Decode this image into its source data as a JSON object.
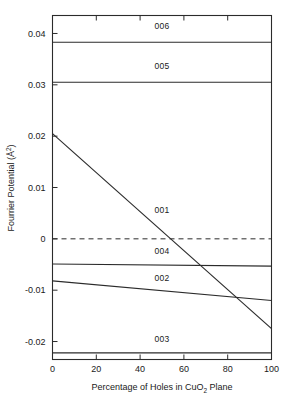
{
  "chart_data": {
    "type": "line",
    "title": "",
    "xlabel": "Percentage of Holes in CuO2  Plane",
    "xlabel_parts": {
      "before": "Percentage of Holes in CuO",
      "sub": "2",
      "after": " Plane"
    },
    "ylabel": "Fourrier Potential (Å²)",
    "ylabel_parts": {
      "before": "Fourrier Potential (Å",
      "sup": "2",
      "after": ")"
    },
    "xlim": [
      0,
      100
    ],
    "ylim": [
      -0.0235,
      0.0435
    ],
    "grid": false,
    "legend": "inline-labels",
    "x_ticks": [
      0,
      20,
      40,
      60,
      80,
      100
    ],
    "x_tick_labels": [
      "0",
      "20",
      "40",
      "60",
      "80",
      "100"
    ],
    "y_ticks": [
      0.04,
      0.03,
      0.02,
      0.01,
      0,
      -0.01,
      -0.02
    ],
    "y_tick_labels": [
      "0.04",
      "0.03",
      "0.02",
      "0.01",
      "0",
      "-0.01",
      "-0.02"
    ],
    "zero_reference_line": {
      "value": 0,
      "style": "dashed"
    },
    "x": [
      0,
      100
    ],
    "series": [
      {
        "name": "006",
        "label": "006",
        "values": [
          0.0383,
          0.0383
        ],
        "label_x": 50,
        "label_y": 0.0408
      },
      {
        "name": "005",
        "label": "005",
        "values": [
          0.0305,
          0.0305
        ],
        "label_x": 50,
        "label_y": 0.033
      },
      {
        "name": "001",
        "label": "001",
        "values": [
          0.0205,
          -0.0175
        ],
        "label_x": 50,
        "label_y": 0.005
      },
      {
        "name": "004",
        "label": "004",
        "values": [
          -0.0049,
          -0.0053
        ],
        "label_x": 50,
        "label_y": -0.003
      },
      {
        "name": "002",
        "label": "002",
        "values": [
          -0.0082,
          -0.012
        ],
        "label_x": 50,
        "label_y": -0.0082
      },
      {
        "name": "003",
        "label": "003",
        "values": [
          -0.0222,
          -0.0222
        ],
        "label_x": 50,
        "label_y": -0.02
      }
    ],
    "colors": {
      "line": "#2b2b2b",
      "axis": "#2b2b2b",
      "background": "#ffffff",
      "text": "#1a1a1a"
    }
  }
}
